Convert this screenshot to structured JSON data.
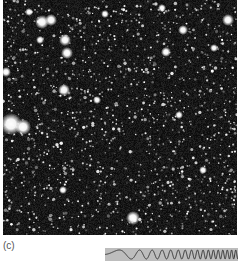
{
  "figure": {
    "panel_label": "(c)",
    "image": {
      "description": "grayscale astronomical star field",
      "background_color": "#101010",
      "star_color": "#ffffff",
      "bright_stars": [
        {
          "x": 39,
          "y": 22,
          "r": 3.5
        },
        {
          "x": 48,
          "y": 20,
          "r": 3
        },
        {
          "x": 62,
          "y": 40,
          "r": 3
        },
        {
          "x": 64,
          "y": 53,
          "r": 3
        },
        {
          "x": 8,
          "y": 124,
          "r": 5.5
        },
        {
          "x": 20,
          "y": 127,
          "r": 4
        },
        {
          "x": 61,
          "y": 90,
          "r": 3
        },
        {
          "x": 37,
          "y": 40,
          "r": 2
        },
        {
          "x": 159,
          "y": 8,
          "r": 2
        },
        {
          "x": 163,
          "y": 52,
          "r": 2.5
        },
        {
          "x": 180,
          "y": 30,
          "r": 2.5
        },
        {
          "x": 225,
          "y": 20,
          "r": 3
        },
        {
          "x": 211,
          "y": 48,
          "r": 2
        },
        {
          "x": 130,
          "y": 218,
          "r": 3.5
        },
        {
          "x": 26,
          "y": 12,
          "r": 2
        },
        {
          "x": 3,
          "y": 72,
          "r": 2.5
        },
        {
          "x": 102,
          "y": 14,
          "r": 2
        },
        {
          "x": 176,
          "y": 115,
          "r": 2
        },
        {
          "x": 60,
          "y": 190,
          "r": 2
        },
        {
          "x": 94,
          "y": 100,
          "r": 2
        },
        {
          "x": 200,
          "y": 170,
          "r": 2
        }
      ],
      "faint_star_count": 1400,
      "seed": 7
    },
    "chirp": {
      "description": "chirp signal strip (increasing frequency left to right)",
      "background_color": "#bdbdbd",
      "line_color": "#333333",
      "cycles": 18
    }
  }
}
